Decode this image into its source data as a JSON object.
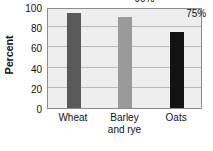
{
  "chart_data": {
    "type": "bar",
    "title": "",
    "xlabel": "",
    "ylabel": "Percent",
    "categories": [
      "Wheat",
      "Barley and rye",
      "Oats"
    ],
    "category_lines": [
      [
        "Wheat"
      ],
      [
        "Barley",
        "and rye"
      ],
      [
        "Oats"
      ]
    ],
    "values": [
      94,
      90,
      75
    ],
    "data_labels": [
      "94%",
      "90%",
      "75%"
    ],
    "ylim": [
      0,
      100
    ],
    "ytick_values": [
      0,
      20,
      40,
      60,
      80,
      100
    ],
    "ytick_labels": [
      "0",
      "20",
      "40",
      "60",
      "80",
      "100"
    ],
    "grid": true,
    "legend": false,
    "bar_colors": [
      "#595959",
      "#9a9a9a",
      "#121212"
    ],
    "plot_background": "#eeeeee",
    "gridline_color": "#b9b9b9",
    "axis_border_color": "#8d8d8d"
  }
}
